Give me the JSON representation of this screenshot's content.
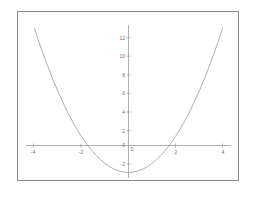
{
  "figure": {
    "background_color": "#ffffff",
    "frame_color": "#8a8a8a",
    "axis_color": "#9a9a9a",
    "curve_color": "#9a9a9a",
    "label_color": "#6e6e6e"
  },
  "chart_data": {
    "type": "line",
    "title": "",
    "subtitle": "",
    "xlabel": "",
    "ylabel": "",
    "grid": false,
    "legend": null,
    "xlim": [
      -4.6,
      4.6
    ],
    "ylim": [
      -3.6,
      13.6
    ],
    "xticks": [
      -4,
      -2,
      0,
      2,
      4
    ],
    "xtick_labels": [
      "-4",
      "-2",
      "0",
      "2",
      "4"
    ],
    "yticks": [
      -2,
      0,
      2,
      4,
      6,
      8,
      10,
      12
    ],
    "ytick_labels": [
      "-2",
      "0",
      "2",
      "4",
      "6",
      "8",
      "10",
      "12"
    ],
    "series": [
      {
        "name": "y = x^2 - 3",
        "x": [
          -4.0,
          -3.8,
          -3.6,
          -3.4,
          -3.2,
          -3.0,
          -2.8,
          -2.6,
          -2.4,
          -2.2,
          -2.0,
          -1.8,
          -1.6,
          -1.4,
          -1.2,
          -1.0,
          -0.8,
          -0.6,
          -0.4,
          -0.2,
          0.0,
          0.2,
          0.4,
          0.6,
          0.8,
          1.0,
          1.2,
          1.4,
          1.6,
          1.8,
          2.0,
          2.2,
          2.4,
          2.6,
          2.8,
          3.0,
          3.2,
          3.4,
          3.6,
          3.8,
          4.0
        ],
        "y": [
          13.0,
          11.44,
          9.96,
          8.56,
          7.24,
          6.0,
          4.84,
          3.76,
          2.76,
          1.84,
          1.0,
          0.24,
          -0.44,
          -1.04,
          -1.56,
          -2.0,
          -2.36,
          -2.64,
          -2.84,
          -2.96,
          -3.0,
          -2.96,
          -2.84,
          -2.64,
          -2.36,
          -2.0,
          -1.56,
          -1.04,
          -0.44,
          0.24,
          1.0,
          1.84,
          2.76,
          3.76,
          4.84,
          6.0,
          7.24,
          8.56,
          9.96,
          11.44,
          13.0
        ]
      }
    ],
    "vertex": [
      0,
      -3
    ],
    "x_intercepts": [
      -1.732,
      1.732
    ],
    "y_intercept": -3
  }
}
